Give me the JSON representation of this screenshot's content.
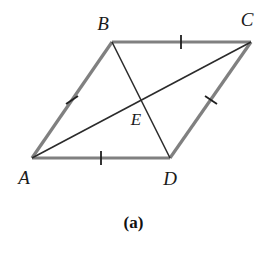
{
  "figure": {
    "caption": "(a)",
    "caption_x": 137,
    "caption_y": 222,
    "width": 267,
    "height": 255,
    "background_color": "#ffffff"
  },
  "style": {
    "side_color": "#808080",
    "side_width": 3.2,
    "diagonal_color": "#2b2b2b",
    "diagonal_width": 1.6,
    "tick_color": "#1f1f1f",
    "tick_width": 1.8,
    "tick_length": 13,
    "label_color": "#1a1a1a"
  },
  "points": [
    {
      "name": "A",
      "x": 32,
      "y": 158,
      "label_x": 24,
      "label_y": 177
    },
    {
      "name": "B",
      "x": 112,
      "y": 42,
      "label_x": 103,
      "label_y": 23
    },
    {
      "name": "C",
      "x": 251,
      "y": 42,
      "label_x": 247,
      "label_y": 19
    },
    {
      "name": "D",
      "x": 170,
      "y": 158,
      "label_x": 170,
      "label_y": 178
    },
    {
      "name": "E",
      "x": 141,
      "y": 101,
      "label_x": 136,
      "label_y": 119
    }
  ],
  "sides": [
    {
      "name": "AB",
      "from": "A",
      "to": "B",
      "x1": 32,
      "y1": 158,
      "x2": 112,
      "y2": 42
    },
    {
      "name": "BC",
      "from": "B",
      "to": "C",
      "x1": 112,
      "y1": 42,
      "x2": 251,
      "y2": 42
    },
    {
      "name": "CD",
      "from": "C",
      "to": "D",
      "x1": 251,
      "y1": 42,
      "x2": 170,
      "y2": 158
    },
    {
      "name": "DA",
      "from": "D",
      "to": "A",
      "x1": 170,
      "y1": 158,
      "x2": 32,
      "y2": 158
    }
  ],
  "diagonals": [
    {
      "name": "AC",
      "from": "A",
      "to": "C",
      "x1": 32,
      "y1": 158,
      "x2": 251,
      "y2": 42
    },
    {
      "name": "BD",
      "from": "B",
      "to": "D",
      "x1": 112,
      "y1": 42,
      "x2": 170,
      "y2": 158
    }
  ],
  "tick_marks": [
    {
      "name": "tick-AB",
      "on": "AB",
      "cx": 72,
      "cy": 100,
      "x1": 66,
      "y1": 104,
      "x2": 78,
      "y2": 96
    },
    {
      "name": "tick-BC",
      "on": "BC",
      "cx": 181,
      "cy": 42,
      "x1": 181,
      "y1": 35,
      "x2": 181,
      "y2": 49
    },
    {
      "name": "tick-CD",
      "on": "CD",
      "cx": 211,
      "cy": 100,
      "x1": 205,
      "y1": 96,
      "x2": 217,
      "y2": 104
    },
    {
      "name": "tick-AD",
      "on": "DA",
      "cx": 101,
      "cy": 158,
      "x1": 101,
      "y1": 151,
      "x2": 101,
      "y2": 165
    }
  ],
  "chart_data": {
    "type": "diagram",
    "title": "(a)",
    "shape": "parallelogram",
    "vertices": {
      "A": [
        32,
        158
      ],
      "B": [
        112,
        42
      ],
      "C": [
        251,
        42
      ],
      "D": [
        170,
        158
      ]
    },
    "intersection_point": {
      "label": "E",
      "coords": [
        141,
        101
      ]
    },
    "edges": [
      "AB",
      "BC",
      "CD",
      "DA"
    ],
    "diagonals": [
      "AC",
      "BD"
    ],
    "congruence_marks": {
      "single_tick": [
        "AB",
        "BC",
        "CD",
        "DA"
      ]
    },
    "annotations": [
      "E is the intersection of diagonals AC and BD",
      "All four sides marked with a single tick (congruent)"
    ]
  }
}
